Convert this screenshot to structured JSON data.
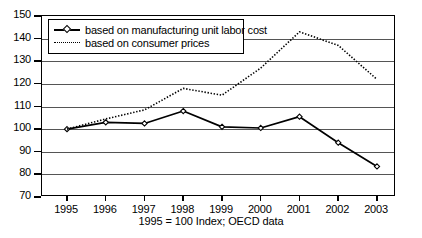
{
  "chart_data": {
    "type": "line",
    "title": "",
    "subtitle": "",
    "caption": "1995 = 100 Index; OECD data",
    "xlabel": "",
    "ylabel": "",
    "categories": [
      "1995",
      "1996",
      "1997",
      "1998",
      "1999",
      "2000",
      "2001",
      "2002",
      "2003"
    ],
    "x": [
      1995,
      1996,
      1997,
      1998,
      1999,
      2000,
      2001,
      2002,
      2003
    ],
    "ylim": [
      70,
      150
    ],
    "yticks": [
      70,
      80,
      90,
      100,
      110,
      120,
      130,
      140,
      150
    ],
    "ytick_labels": [
      "70",
      "80",
      "90",
      "100",
      "110",
      "120",
      "130",
      "140",
      "150"
    ],
    "grid": true,
    "grid_axis": "y",
    "legend_position": "top-left",
    "series": [
      {
        "name": "based on manufacturing unit labor cost",
        "style": "solid",
        "marker": "open-diamond",
        "color": "#000000",
        "values": [
          100,
          103,
          102.5,
          108,
          101,
          100.5,
          105.5,
          94,
          83.5
        ]
      },
      {
        "name": "based on consumer prices",
        "style": "dotted",
        "marker": "none",
        "color": "#000000",
        "values": [
          100,
          104.5,
          108.5,
          118,
          115,
          127,
          143,
          137,
          122
        ]
      }
    ]
  },
  "legend": {
    "items": [
      {
        "label": "based on manufacturing unit labor cost"
      },
      {
        "label": "based on consumer prices"
      }
    ]
  },
  "caption": {
    "text": "1995 = 100 Index; OECD data"
  }
}
